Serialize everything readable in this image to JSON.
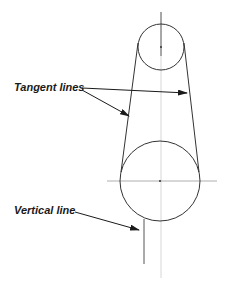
{
  "diagram": {
    "labels": {
      "tangent_lines": "Tangent lines",
      "vertical_line": "Vertical line"
    },
    "colors": {
      "line": "#333333",
      "centerline": "#bbbbbb",
      "text": "#1a1a1a",
      "background": "#ffffff"
    },
    "elements": {
      "small_circle": {
        "cx": 161,
        "cy": 47,
        "r": 23
      },
      "large_circle": {
        "cx": 160,
        "cy": 181,
        "r": 40
      },
      "vertical_line": {
        "x": 144,
        "y1": 219,
        "y2": 264
      }
    }
  }
}
